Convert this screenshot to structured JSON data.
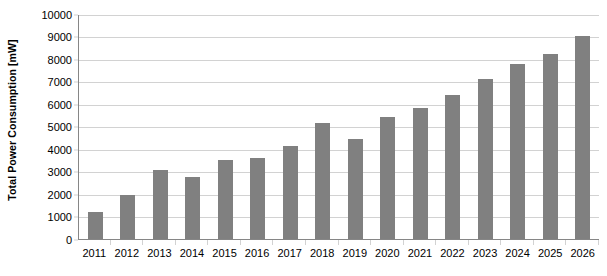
{
  "chart_data": {
    "type": "bar",
    "title": "",
    "xlabel": "",
    "ylabel": "Total Power Consumption [mW]",
    "categories": [
      "2011",
      "2012",
      "2013",
      "2014",
      "2015",
      "2016",
      "2017",
      "2018",
      "2019",
      "2020",
      "2021",
      "2022",
      "2023",
      "2024",
      "2025",
      "2026"
    ],
    "values": [
      1200,
      1950,
      3050,
      2750,
      3500,
      3600,
      4100,
      5150,
      4450,
      5400,
      5800,
      6400,
      7100,
      7750,
      8200,
      9000
    ],
    "ylim": [
      0,
      10000
    ],
    "y_ticks": [
      0,
      1000,
      2000,
      3000,
      4000,
      5000,
      6000,
      7000,
      8000,
      9000,
      10000
    ],
    "y_tick_labels": [
      "0",
      "1000",
      "2000",
      "3000",
      "4000",
      "5000",
      "6000",
      "7000",
      "8000",
      "9000",
      "10000"
    ],
    "grid": true,
    "legend": false,
    "legend_position": "none",
    "series": [
      {
        "name": "Total Power Consumption",
        "values": [
          1200,
          1950,
          3050,
          2750,
          3500,
          3600,
          4100,
          5150,
          4450,
          5400,
          5800,
          6400,
          7100,
          7750,
          8200,
          9000
        ]
      }
    ]
  },
  "colors": {
    "bar_fill": "#808080",
    "gridline": "#d2d2d2",
    "axis_line": "#868686",
    "text": "#000000",
    "background": "#ffffff"
  }
}
